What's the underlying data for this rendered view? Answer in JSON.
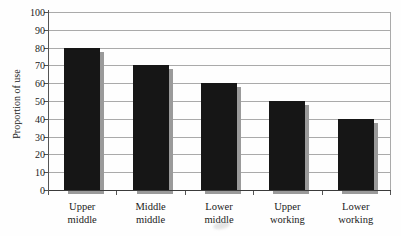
{
  "chart_data": {
    "type": "bar",
    "title": "",
    "ylabel": "Proportion of use",
    "xlabel": "",
    "categories": [
      "Upper middle",
      "Middle middle",
      "Lower middle",
      "Upper working",
      "Lower working"
    ],
    "category_label_lines": [
      [
        "Upper",
        "middle"
      ],
      [
        "Middle",
        "middle"
      ],
      [
        "Lower",
        "middle"
      ],
      [
        "Upper",
        "working"
      ],
      [
        "Lower",
        "working"
      ]
    ],
    "values": [
      80,
      70,
      60,
      50,
      40
    ],
    "ylim": [
      0,
      100
    ],
    "ytick_step": 10,
    "ytick_labels": [
      "0",
      "10",
      "20",
      "30",
      "40",
      "50",
      "60",
      "70",
      "80",
      "90",
      "100"
    ],
    "grid": true,
    "legend_position": "none",
    "colors": {
      "bar_fill": "#161616",
      "bar_shadow": "#9a9a9a",
      "gridline": "#aaaaaa",
      "axis": "#555555",
      "text": "#1a1a1a",
      "background": "#fefefe"
    }
  }
}
